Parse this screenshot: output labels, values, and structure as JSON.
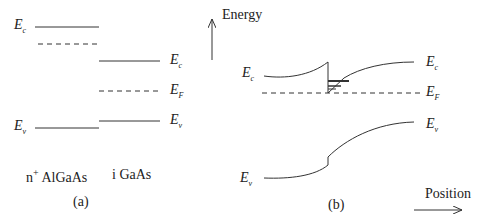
{
  "panel_a": {
    "caption": "(a)",
    "material_left": "AlGaAs",
    "material_left_prefix": "n",
    "material_left_sup": "+",
    "material_right": "i GaAs",
    "labels": {
      "ec_left": {
        "main": "E",
        "sub": "c"
      },
      "ev_left": {
        "main": "E",
        "sub": "v"
      },
      "ec_right": {
        "main": "E",
        "sub": "c"
      },
      "ef_right": {
        "main": "E",
        "sub": "F"
      },
      "ev_right": {
        "main": "E",
        "sub": "v"
      }
    }
  },
  "panel_b": {
    "caption": "(b)",
    "y_axis_label": "Energy",
    "x_axis_label": "Position",
    "labels": {
      "ec_left": {
        "main": "E",
        "sub": "c"
      },
      "ev_left": {
        "main": "E",
        "sub": "v"
      },
      "ec_right": {
        "main": "E",
        "sub": "c"
      },
      "ef_right": {
        "main": "E",
        "sub": "F"
      },
      "ev_right": {
        "main": "E",
        "sub": "v"
      }
    }
  },
  "colors": {
    "line": "#333333",
    "background": "#ffffff"
  }
}
